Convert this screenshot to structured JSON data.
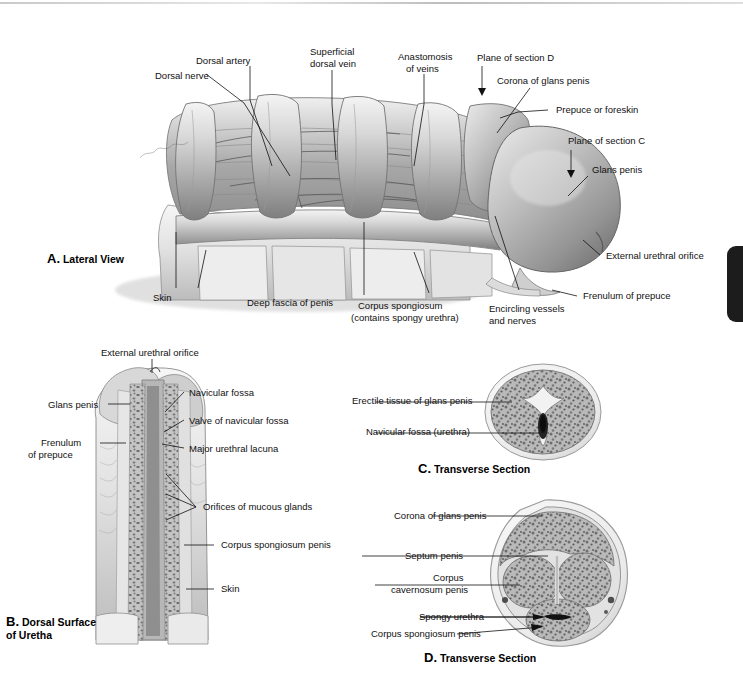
{
  "figure": {
    "background": "#ffffff",
    "ink": "#111111",
    "side_tab_color": "#1c1c1c"
  },
  "panels": [
    {
      "id": "A",
      "letter": "A.",
      "name": "Lateral View",
      "title": "A. Lateral View"
    },
    {
      "id": "B",
      "letter": "B.",
      "name": "Dorsal Surface\nof Uretha",
      "title": "B. Dorsal Surface of Uretha"
    },
    {
      "id": "C",
      "letter": "C.",
      "name": "Transverse Section",
      "title": "C. Transverse Section"
    },
    {
      "id": "D",
      "letter": "D.",
      "name": "Transverse Section",
      "title": "D. Transverse Section"
    }
  ],
  "panel_a": {
    "labels": [
      {
        "key": "dorsal_nerve",
        "text": "Dorsal nerve"
      },
      {
        "key": "dorsal_artery",
        "text": "Dorsal artery"
      },
      {
        "key": "superficial_dorsal_vein_1",
        "text": "Superficial"
      },
      {
        "key": "superficial_dorsal_vein_2",
        "text": "dorsal vein"
      },
      {
        "key": "anastomosis_1",
        "text": "Anastomosis"
      },
      {
        "key": "anastomosis_2",
        "text": "of veins"
      },
      {
        "key": "plane_of_section_d",
        "text": "Plane of section D"
      },
      {
        "key": "corona_of_glans_penis",
        "text": "Corona of glans penis"
      },
      {
        "key": "prepuce_or_foreskin",
        "text": "Prepuce or foreskin"
      },
      {
        "key": "plane_of_section_c",
        "text": "Plane of section C"
      },
      {
        "key": "glans_penis",
        "text": "Glans penis"
      },
      {
        "key": "external_urethral_orifice",
        "text": "External urethral orifice"
      },
      {
        "key": "frenulum_of_prepuce",
        "text": "Frenulum of prepuce"
      },
      {
        "key": "encircling_vessels_1",
        "text": "Encircling vessels"
      },
      {
        "key": "encircling_vessels_2",
        "text": "and nerves"
      },
      {
        "key": "corpus_spongiosum_1",
        "text": "Corpus spongiosum"
      },
      {
        "key": "corpus_spongiosum_2",
        "text": "(contains spongy urethra)"
      },
      {
        "key": "deep_fascia_of_penis",
        "text": "Deep fascia of penis"
      },
      {
        "key": "skin",
        "text": "Skin"
      }
    ]
  },
  "panel_b": {
    "labels": [
      {
        "key": "external_urethral_orifice",
        "text": "External urethral orifice"
      },
      {
        "key": "glans_penis",
        "text": "Glans penis"
      },
      {
        "key": "navicular_fossa",
        "text": "Navicular fossa"
      },
      {
        "key": "valve_of_navicular_fossa",
        "text": "Valve of navicular fossa"
      },
      {
        "key": "frenulum_1",
        "text": "Frenulum"
      },
      {
        "key": "frenulum_2",
        "text": "of prepuce"
      },
      {
        "key": "major_urethral_lacuna",
        "text": "Major urethral lacuna"
      },
      {
        "key": "orifices_of_mucous_glands",
        "text": "Orifices of mucous glands"
      },
      {
        "key": "corpus_spongiosum_penis",
        "text": "Corpus spongiosum penis"
      },
      {
        "key": "skin",
        "text": "Skin"
      }
    ]
  },
  "panel_c": {
    "labels": [
      {
        "key": "erectile_tissue_of_glans_penis",
        "text": "Erectile tissue of glans penis"
      },
      {
        "key": "navicular_fossa_urethra",
        "text": "Navicular fossa (urethra)"
      }
    ]
  },
  "panel_d": {
    "labels": [
      {
        "key": "corona_of_glans_penis",
        "text": "Corona of glans penis"
      },
      {
        "key": "septum_penis",
        "text": "Septum penis"
      },
      {
        "key": "corpus_cavernosum_1",
        "text": "Corpus"
      },
      {
        "key": "corpus_cavernosum_2",
        "text": "cavernosum penis"
      },
      {
        "key": "spongy_urethra",
        "text": "Spongy urethra"
      },
      {
        "key": "corpus_spongiosum_penis",
        "text": "Corpus spongiosum penis"
      }
    ]
  }
}
